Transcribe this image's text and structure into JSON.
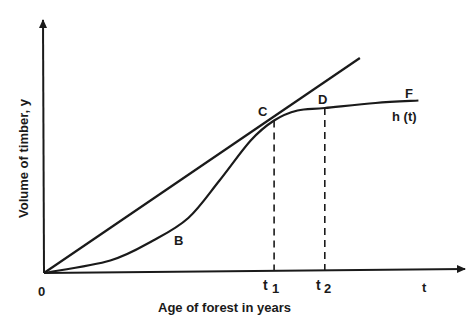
{
  "chart_data": {
    "type": "line",
    "title": "",
    "xlabel": "Age of forest in years",
    "ylabel": "Volume of timber, y",
    "x_axis_symbol": "t",
    "origin_label": "0",
    "x_ticks": [
      {
        "label_main": "t",
        "label_sub": "1",
        "value": 0.59
      },
      {
        "label_main": "t",
        "label_sub": "2",
        "value": 0.72
      }
    ],
    "x_range": [
      0,
      1
    ],
    "y_range": [
      0,
      1
    ],
    "grid": false,
    "series": [
      {
        "name": "tangent line",
        "style": "solid",
        "points": [
          [
            0,
            0
          ],
          [
            0.81,
            0.86
          ]
        ]
      },
      {
        "name": "h (t)",
        "style": "solid",
        "points": [
          [
            0,
            0
          ],
          [
            0.17,
            0.05
          ],
          [
            0.28,
            0.13
          ],
          [
            0.37,
            0.22
          ],
          [
            0.45,
            0.37
          ],
          [
            0.53,
            0.53
          ],
          [
            0.59,
            0.61
          ],
          [
            0.65,
            0.65
          ],
          [
            0.72,
            0.66
          ],
          [
            0.85,
            0.68
          ],
          [
            0.96,
            0.69
          ]
        ]
      }
    ],
    "annotations": [
      {
        "text": "B",
        "x": 0.35,
        "y": 0.15
      },
      {
        "text": "C",
        "x": 0.58,
        "y": 0.66
      },
      {
        "text": "D",
        "x": 0.72,
        "y": 0.72
      },
      {
        "text": "F",
        "x": 0.95,
        "y": 0.73
      },
      {
        "text": "h (t)",
        "x": 0.94,
        "y": 0.62
      }
    ],
    "dropline_style": "dashed"
  }
}
